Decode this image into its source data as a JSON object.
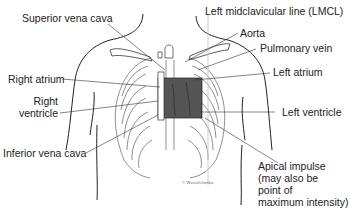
{
  "labels": {
    "superior_vena_cava": "Superior vena cava",
    "lmcl": "Left midclavicular line (LMCL)",
    "aorta": "Aorta",
    "pulmonary_vein": "Pulmonary vein",
    "left_atrium": "Left atrium",
    "right_atrium": "Right atrium",
    "right_ventricle_line1": "Right",
    "right_ventricle_line2": "ventricle",
    "left_ventricle": "Left ventricle",
    "inferior_vena_cava": "Inferior vena cava",
    "apical_line1": "Apical impulse",
    "apical_line2": "(may also be",
    "apical_line3": "point of",
    "apical_line4": "maximum intensity)"
  },
  "signature": "© Wassilchenko",
  "colors": {
    "heart_fill": "#555555",
    "line": "#222222",
    "lmcl_line": "#cccccc"
  }
}
